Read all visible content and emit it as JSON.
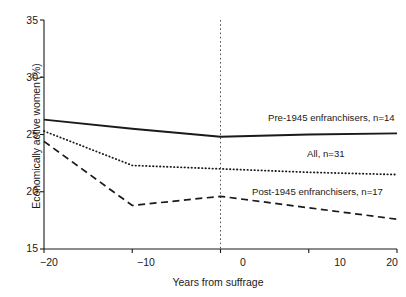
{
  "chart_data": {
    "type": "line",
    "title": "",
    "xlabel": "Years from suffrage",
    "ylabel": "Economically active women (%)",
    "xlim": [
      -20,
      20
    ],
    "ylim": [
      15,
      35
    ],
    "xticks": [
      "−20",
      "−10",
      "0",
      "10",
      "20"
    ],
    "xtick_values": [
      -20,
      -10,
      0,
      10,
      20
    ],
    "yticks": [
      "35",
      "30",
      "25",
      "20",
      "15"
    ],
    "ytick_values": [
      35,
      30,
      25,
      20,
      15
    ],
    "grid": false,
    "legend_position": "inline-annotations",
    "reference_line": {
      "x": 0,
      "style": "dotted",
      "label": ""
    },
    "x": [
      -20,
      -10,
      0,
      10,
      20
    ],
    "series": [
      {
        "name": "Pre-1945 enfranchisers, n=14",
        "label": "Pre-1945 enfranchisers, n=14",
        "style": "solid",
        "color": "#1a1a1a",
        "values": [
          26.3,
          25.5,
          24.8,
          25.0,
          25.1
        ]
      },
      {
        "name": "All, n=31",
        "label": "All, n=31",
        "style": "dotted",
        "color": "#1a1a1a",
        "values": [
          25.3,
          22.3,
          22.0,
          21.7,
          21.5
        ]
      },
      {
        "name": "Post-1945 enfranchisers, n=17",
        "label": "Post-1945 enfranchisers, n=17",
        "style": "dashed",
        "color": "#1a1a1a",
        "values": [
          24.4,
          18.8,
          19.6,
          18.6,
          17.6
        ]
      }
    ]
  },
  "axes": {
    "y_title": "Economically active women (%)",
    "x_title": "Years from suffrage"
  },
  "annotations": {
    "pre": "Pre-1945 enfranchisers, n=14",
    "all": "All, n=31",
    "post": "Post-1945 enfranchisers, n=17"
  },
  "cropped_caption": ""
}
